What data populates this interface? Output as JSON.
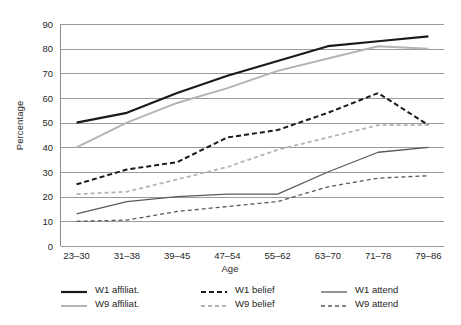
{
  "chart_data": {
    "type": "line",
    "title": "",
    "xlabel": "Age",
    "ylabel": "Percentage",
    "categories": [
      "23–30",
      "31–38",
      "39–45",
      "47–54",
      "55–62",
      "63–70",
      "71–78",
      "79–86"
    ],
    "ylim": [
      0,
      90
    ],
    "yticks": [
      0,
      10,
      20,
      30,
      40,
      50,
      60,
      70,
      80,
      90
    ],
    "grid": "horizontal",
    "legend_position": "bottom",
    "series": [
      {
        "name": "W1 affiliat.",
        "values": [
          50,
          54,
          62,
          69,
          75,
          81,
          83,
          85
        ],
        "color": "#1a1a1a",
        "style": "solid",
        "width": 2.2
      },
      {
        "name": "W9 affiliat.",
        "values": [
          40,
          50,
          58,
          64,
          71,
          76,
          81,
          80
        ],
        "color": "#b4b4b4",
        "style": "solid",
        "width": 2.0
      },
      {
        "name": "W1 belief",
        "values": [
          25,
          31,
          34,
          44,
          47,
          54,
          62,
          49
        ],
        "color": "#1a1a1a",
        "style": "dashed",
        "width": 2.0
      },
      {
        "name": "W9 belief",
        "values": [
          21,
          22,
          27,
          32,
          39,
          44,
          49,
          49
        ],
        "color": "#b4b4b4",
        "style": "dashed",
        "width": 1.8
      },
      {
        "name": "W1 attend",
        "values": [
          13,
          18,
          20,
          21,
          21,
          30,
          38,
          40
        ],
        "color": "#595959",
        "style": "solid",
        "width": 1.3
      },
      {
        "name": "W9 attend",
        "values": [
          10,
          10.5,
          14,
          16,
          18,
          24,
          27.5,
          28.5
        ],
        "color": "#595959",
        "style": "dashed",
        "width": 1.3
      }
    ]
  },
  "legend": {
    "columns": [
      [
        "W1 affiliat.",
        "W9 affiliat."
      ],
      [
        "W1 belief",
        "W9 belief"
      ],
      [
        "W1 attend",
        "W9 attend"
      ]
    ]
  }
}
